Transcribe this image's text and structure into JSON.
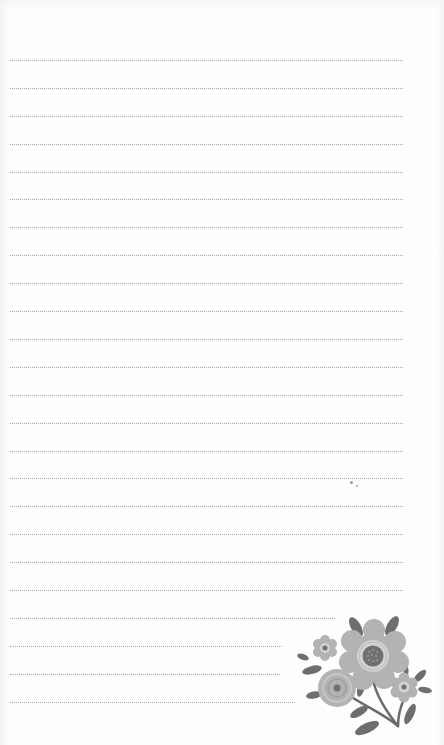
{
  "page": {
    "type": "lined-notepaper",
    "background": "#fefefe",
    "rule_color": "#8c8c8c",
    "rule_style": "dotted",
    "rule_left": 10,
    "rules": [
      {
        "y": 60,
        "right": 403
      },
      {
        "y": 88,
        "right": 403
      },
      {
        "y": 116,
        "right": 403
      },
      {
        "y": 144,
        "right": 403
      },
      {
        "y": 172,
        "right": 403
      },
      {
        "y": 199,
        "right": 403
      },
      {
        "y": 227,
        "right": 403
      },
      {
        "y": 255,
        "right": 403
      },
      {
        "y": 283,
        "right": 403
      },
      {
        "y": 311,
        "right": 403
      },
      {
        "y": 339,
        "right": 403
      },
      {
        "y": 367,
        "right": 403
      },
      {
        "y": 395,
        "right": 403
      },
      {
        "y": 423,
        "right": 403
      },
      {
        "y": 451,
        "right": 403
      },
      {
        "y": 478,
        "right": 403
      },
      {
        "y": 506,
        "right": 403
      },
      {
        "y": 534,
        "right": 403
      },
      {
        "y": 562,
        "right": 403
      },
      {
        "y": 590,
        "right": 403
      },
      {
        "y": 618,
        "right": 335
      },
      {
        "y": 646,
        "right": 282
      },
      {
        "y": 674,
        "right": 280
      },
      {
        "y": 702,
        "right": 295
      }
    ]
  },
  "decoration": {
    "name": "floral-illustration",
    "palette": {
      "petal": "#b3b3b3",
      "petal_light": "#d2d2d2",
      "center": "#707070",
      "leaf": "#6e6e6e",
      "stem": "#6a6a6a"
    }
  }
}
